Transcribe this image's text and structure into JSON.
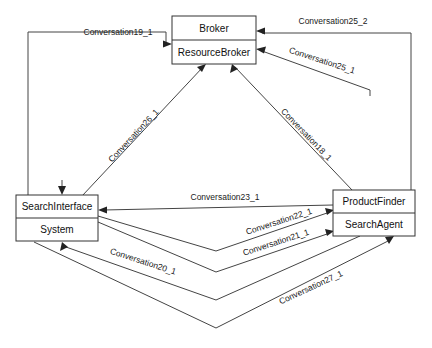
{
  "diagram": {
    "type": "uml-collaboration-diagram",
    "background_color": "#ffffff",
    "line_color": "#444444",
    "text_color": "#1a1a1a",
    "nodes": [
      {
        "id": "broker",
        "name": "broker-node",
        "top_label": "Broker",
        "bottom_label": "ResourceBroker",
        "x": 172,
        "y": 16,
        "width": 84,
        "height": 48
      },
      {
        "id": "searchinterface",
        "name": "search-interface-node",
        "top_label": "SearchInterface",
        "bottom_label": "System",
        "x": 16,
        "y": 195,
        "width": 82,
        "height": 46
      },
      {
        "id": "productfinder",
        "name": "product-finder-node",
        "top_label": "ProductFinder",
        "bottom_label": "SearchAgent",
        "x": 333,
        "y": 190,
        "width": 82,
        "height": 46
      }
    ],
    "edges": [
      {
        "id": "conv19",
        "name": "edge-conversation19-1",
        "label": "Conversation19_1",
        "from": "searchinterface",
        "to": "broker",
        "label_x": 118,
        "label_y": 33,
        "label_rotation": 0
      },
      {
        "id": "conv25_2",
        "name": "edge-conversation25-2",
        "label": "Conversation25_2",
        "from": "productfinder",
        "to": "broker",
        "label_x": 333,
        "label_y": 22,
        "label_rotation": 0
      },
      {
        "id": "conv25_1",
        "name": "edge-conversation25-1",
        "label": "Conversation25_1",
        "from": "productfinder",
        "to": "broker",
        "label_x": 322,
        "label_y": 61,
        "label_rotation": 18
      },
      {
        "id": "conv26",
        "name": "edge-conversation26-1",
        "label": "Conversation26_1",
        "from": "searchinterface",
        "to": "broker",
        "label_x": 134,
        "label_y": 136,
        "label_rotation": 56
      },
      {
        "id": "conv18",
        "name": "edge-conversation18-1",
        "label": "Conversation18_1",
        "from": "productfinder",
        "to": "broker",
        "label_x": 306,
        "label_y": 135,
        "label_rotation": -58
      },
      {
        "id": "conv23",
        "name": "edge-conversation23-1",
        "label": "Conversation23_1",
        "from": "productfinder",
        "to": "searchinterface",
        "label_x": 225,
        "label_y": 198,
        "label_rotation": 0
      },
      {
        "id": "conv22",
        "name": "edge-conversation22-1",
        "label": "Conversation22_1",
        "from": "searchinterface",
        "to": "productfinder",
        "label_x": 279,
        "label_y": 222,
        "label_rotation": -12
      },
      {
        "id": "conv21",
        "name": "edge-conversation21-1",
        "label": "Conversation21_1",
        "from": "searchinterface",
        "to": "productfinder",
        "label_x": 276,
        "label_y": 243,
        "label_rotation": -12
      },
      {
        "id": "conv20",
        "name": "edge-conversation20-1",
        "label": "Conversation20_1",
        "from": "productfinder",
        "to": "searchinterface",
        "label_x": 143,
        "label_y": 262,
        "label_rotation": -16
      },
      {
        "id": "conv27",
        "name": "edge-conversation27-1",
        "label": "Conversation27_1",
        "from": "searchinterface",
        "to": "productfinder",
        "label_x": 311,
        "label_y": 288,
        "label_rotation": -18
      }
    ]
  }
}
